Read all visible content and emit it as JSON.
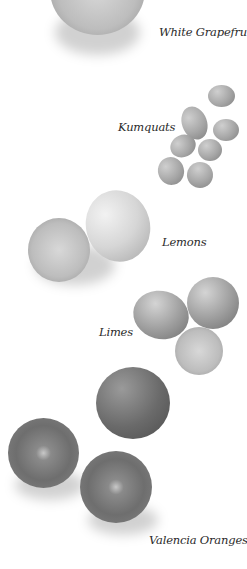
{
  "labels": {
    "white_grapefruits": "White Grapefruits",
    "kumquats": "Kumquats",
    "lemons": "Lemons",
    "limes": "Limes",
    "valencia_oranges": "Valencia Oranges"
  }
}
